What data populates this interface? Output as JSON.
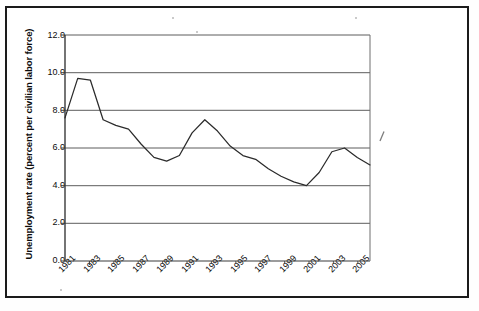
{
  "figure": {
    "border_color": "#1b1b1b",
    "background": "#ffffff"
  },
  "chart_data": {
    "type": "line",
    "title": "",
    "xlabel": "",
    "ylabel": "Unemployment rate (percent per civilian labor force)",
    "ylim": [
      0.0,
      12.0
    ],
    "xlim": [
      1981,
      2005
    ],
    "grid": "horizontal",
    "legend": "none",
    "line_color": "#2b2b2b",
    "y_ticks": [
      "0.0",
      "2.0",
      "4.0",
      "6.0",
      "8.0",
      "10.0",
      "12.0"
    ],
    "x_ticks": [
      "1981",
      "1983",
      "1985",
      "1987",
      "1989",
      "1991",
      "1993",
      "1995",
      "1997",
      "1999",
      "2001",
      "2003",
      "2005"
    ],
    "x": [
      1981,
      1982,
      1983,
      1984,
      1985,
      1986,
      1987,
      1988,
      1989,
      1990,
      1991,
      1992,
      1993,
      1994,
      1995,
      1996,
      1997,
      1998,
      1999,
      2000,
      2001,
      2002,
      2003,
      2004,
      2005
    ],
    "values": [
      7.6,
      9.7,
      9.6,
      7.5,
      7.2,
      7.0,
      6.2,
      5.5,
      5.3,
      5.6,
      6.8,
      7.5,
      6.9,
      6.1,
      5.6,
      5.4,
      4.9,
      4.5,
      4.2,
      4.0,
      4.7,
      5.8,
      6.0,
      5.5,
      5.1
    ]
  },
  "artifacts": {
    "scan_mark": "diagonal-speck"
  }
}
